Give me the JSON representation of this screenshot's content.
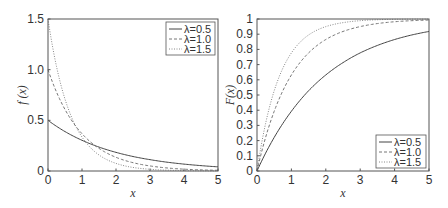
{
  "chart_data": [
    {
      "type": "line",
      "title": "",
      "xlabel": "x",
      "ylabel": "f (x)",
      "xlim": [
        0,
        5
      ],
      "ylim": [
        0,
        1.5
      ],
      "xticks": [
        "0",
        "1",
        "2",
        "3",
        "4",
        "5"
      ],
      "yticks": [
        "0",
        "0.5",
        "1.0",
        "1.5"
      ],
      "grid": false,
      "legend_position": "upper right",
      "x": [
        0,
        0.5,
        1,
        1.5,
        2,
        2.5,
        3,
        3.5,
        4,
        4.5,
        5
      ],
      "series": [
        {
          "name": "λ=0.5",
          "style": "solid",
          "values": [
            0.5,
            0.389,
            0.303,
            0.236,
            0.184,
            0.143,
            0.112,
            0.087,
            0.068,
            0.053,
            0.041
          ]
        },
        {
          "name": "λ=1.0",
          "style": "dashed",
          "values": [
            1.0,
            0.607,
            0.368,
            0.223,
            0.135,
            0.082,
            0.05,
            0.03,
            0.018,
            0.011,
            0.007
          ]
        },
        {
          "name": "λ=1.5",
          "style": "dotted",
          "values": [
            1.5,
            0.709,
            0.335,
            0.158,
            0.075,
            0.035,
            0.017,
            0.008,
            0.004,
            0.002,
            0.001
          ]
        }
      ]
    },
    {
      "type": "line",
      "title": "",
      "xlabel": "x",
      "ylabel": "F(x)",
      "xlim": [
        0,
        5
      ],
      "ylim": [
        0,
        1
      ],
      "xticks": [
        "0",
        "1",
        "2",
        "3",
        "4",
        "5"
      ],
      "yticks": [
        "0",
        "0.1",
        "0.2",
        "0.3",
        "0.4",
        "0.5",
        "0.6",
        "0.7",
        "0.8",
        "0.9",
        "1"
      ],
      "grid": false,
      "legend_position": "lower right",
      "x": [
        0,
        0.5,
        1,
        1.5,
        2,
        2.5,
        3,
        3.5,
        4,
        4.5,
        5
      ],
      "series": [
        {
          "name": "λ=0.5",
          "style": "solid",
          "values": [
            0,
            0.221,
            0.393,
            0.528,
            0.632,
            0.713,
            0.777,
            0.826,
            0.865,
            0.895,
            0.918
          ]
        },
        {
          "name": "λ=1.0",
          "style": "dashed",
          "values": [
            0,
            0.393,
            0.632,
            0.777,
            0.865,
            0.918,
            0.95,
            0.97,
            0.982,
            0.989,
            0.993
          ]
        },
        {
          "name": "λ=1.5",
          "style": "dotted",
          "values": [
            0,
            0.528,
            0.777,
            0.895,
            0.95,
            0.976,
            0.989,
            0.995,
            0.998,
            0.999,
            0.999
          ]
        }
      ]
    }
  ],
  "left": {
    "ylabel": "f (x)",
    "xlabel": "x",
    "xticks": [
      "0",
      "1",
      "2",
      "3",
      "4",
      "5"
    ],
    "yticks": [
      "0",
      "0.5",
      "1.0",
      "1.5"
    ],
    "legend": [
      "λ=0.5",
      "λ=1.0",
      "λ=1.5"
    ]
  },
  "right": {
    "ylabel": "F(x)",
    "xlabel": "x",
    "xticks": [
      "0",
      "1",
      "2",
      "3",
      "4",
      "5"
    ],
    "yticks": [
      "0",
      "0.1",
      "0.2",
      "0.3",
      "0.4",
      "0.5",
      "0.6",
      "0.7",
      "0.8",
      "0.9",
      "1"
    ],
    "legend": [
      "λ=0.5",
      "λ=1.0",
      "λ=1.5"
    ]
  }
}
